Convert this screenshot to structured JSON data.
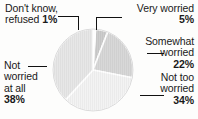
{
  "chart_data": {
    "type": "pie",
    "title": "",
    "subtitle": "",
    "xlabel": "",
    "ylabel": "",
    "legend_position": "callout-labels",
    "grid": false,
    "categories": [
      "Very worried",
      "Somewhat worried",
      "Not too worried",
      "Not worried at all",
      "Don't know, refused"
    ],
    "values": [
      5,
      22,
      34,
      38,
      1
    ],
    "unit": "%",
    "slices": [
      {
        "label": "Very worried",
        "value": 5,
        "value_text": "5%",
        "color": "#8f8f8f",
        "start_angle_deg": 3.6,
        "end_angle_deg": 21.6
      },
      {
        "label": "Somewhat worried",
        "value": 22,
        "value_text": "22%",
        "color": "#a8a8a8",
        "start_angle_deg": 21.6,
        "end_angle_deg": 100.8
      },
      {
        "label": "Not too worried",
        "value": 34,
        "value_text": "34%",
        "color": "#e4e4e4",
        "start_angle_deg": 100.8,
        "end_angle_deg": 223.2
      },
      {
        "label": "Not worried at all",
        "value": 38,
        "value_text": "38%",
        "color": "#c9c9c9",
        "start_angle_deg": 223.2,
        "end_angle_deg": 360.0
      },
      {
        "label": "Don't know, refused",
        "value": 1,
        "value_text": "1%",
        "color": "#fbfbfb",
        "start_angle_deg": 0.0,
        "end_angle_deg": 3.6
      }
    ]
  },
  "labels": {
    "dont_know": {
      "line1": "Don't know,",
      "line2": "refused",
      "pct": "1%"
    },
    "very_worried": {
      "line1": "Very worried",
      "pct": "5%"
    },
    "somewhat_worried": {
      "line1": "Somewhat",
      "line2": "worried",
      "pct": "22%"
    },
    "not_too_worried": {
      "line1": "Not too",
      "line2": "worried",
      "pct": "34%"
    },
    "not_worried_at_all": {
      "line1": "Not",
      "line2": "worried",
      "line3": "at all",
      "pct": "38%"
    }
  },
  "style": {
    "background": "#fdfdfc",
    "text_color": "#1a1a1a",
    "leader_color": "#111111",
    "slice_divider_color": "#ffffff"
  }
}
